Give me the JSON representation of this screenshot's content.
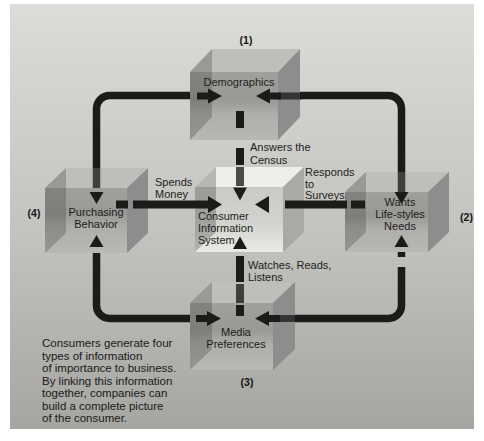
{
  "diagram": {
    "title_semantic": "consumer-information-system-diagram",
    "colors": {
      "ink": "#1b1b19",
      "page": "#ffffff",
      "background_top": "#dcdcd8",
      "background_bottom": "#a5a5a1",
      "box_top_face": "#bebebb",
      "box_side_face": "#8d8d8d",
      "box_front_dark": "#989894",
      "box_front_light": "#b8b8b4",
      "center_top_face": "#efeeea",
      "center_side_face": "#a9a9a5",
      "center_front_light": "#eaeae6",
      "text": "#1d1d1b"
    },
    "numbers": {
      "demographics": "(1)",
      "wants": "(2)",
      "media": "(3)",
      "purchasing": "(4)"
    },
    "boxes": {
      "demographics": {
        "lines": [
          "Demographics"
        ]
      },
      "wants": {
        "lines": [
          "Wants",
          "Life-styles",
          "Needs"
        ]
      },
      "media": {
        "lines": [
          "Media",
          "Preferences"
        ]
      },
      "purchasing": {
        "lines": [
          "Purchasing",
          "Behavior"
        ]
      },
      "center": {
        "lines": [
          "Consumer",
          "Information",
          "System"
        ]
      }
    },
    "connector_labels": {
      "census": {
        "lines": [
          "Answers the",
          "Census"
        ]
      },
      "surveys": {
        "lines": [
          "Responds",
          "to",
          "Surveys"
        ]
      },
      "spends": {
        "lines": [
          "Spends",
          "Money"
        ]
      },
      "watches": {
        "lines": [
          "Watches, Reads,",
          "Listens"
        ]
      }
    },
    "caption": {
      "lines": [
        "Consumers generate four",
        "types of information",
        "of importance to business.",
        "By linking this information",
        "together, companies can",
        "build a complete picture",
        "of the consumer."
      ]
    }
  }
}
